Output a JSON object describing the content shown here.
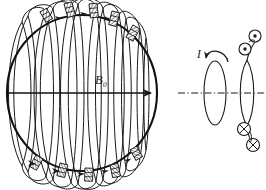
{
  "figure": {
    "background_color": "#ffffff",
    "ink_color": "#1a1a1a",
    "width": 266,
    "height": 190
  },
  "left_panel": {
    "name": "sphere-with-coil-windings",
    "sphere": {
      "center_x": 82,
      "center_y": 93,
      "radius_x": 75,
      "radius_y": 78,
      "stroke_width": 2.0
    },
    "field_arrow": {
      "label": "B₀",
      "label_italic": true,
      "label_x": 101,
      "label_y": 84,
      "from_x": 8,
      "to_x": 157,
      "y": 93,
      "arrowhead": "right"
    },
    "winding_count": 9,
    "winding_labels": [
      "w1",
      "w2",
      "w3",
      "w4",
      "w5",
      "w6",
      "w7",
      "w8",
      "w9"
    ],
    "top_block_count": 5,
    "bottom_block_count": 5,
    "block_style": "hatched-conductor-segment",
    "current_marker_shape": "arrowhead"
  },
  "right_panel": {
    "name": "equivalent-current-loop",
    "axis": {
      "style": "dash-dot",
      "y": 93,
      "from_x": 178,
      "to_x": 266
    },
    "current_label": {
      "text": "I",
      "italic": true,
      "x": 199,
      "y": 58
    },
    "rotation_arrow": {
      "name": "current-direction-arrow",
      "direction": "counterclockwise-down-left"
    },
    "single_loop": {
      "center_x": 215,
      "center_y": 93,
      "radius_x": 11,
      "radius_y": 32
    },
    "coil_loop": {
      "center_x": 247,
      "center_y": 93,
      "radius_x": 10,
      "radius_y": 33
    },
    "current_symbols": {
      "out_of_page": {
        "glyph": "dot-in-circle",
        "count": 2,
        "positions": [
          [
            254,
            36
          ],
          [
            245,
            49
          ]
        ]
      },
      "into_page": {
        "glyph": "cross-in-circle",
        "count": 2,
        "positions": [
          [
            244,
            129
          ],
          [
            253,
            145
          ]
        ]
      }
    }
  }
}
